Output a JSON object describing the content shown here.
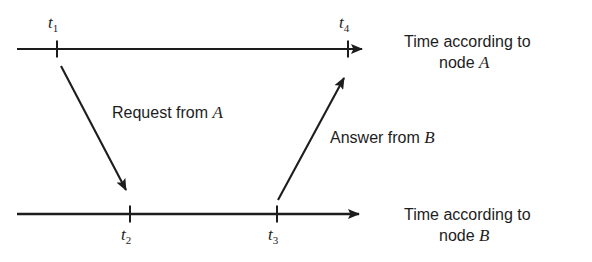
{
  "figure": {
    "background_color": "#ffffff",
    "stroke_color": "#1d1d1d",
    "width": 592,
    "height": 262
  },
  "timelines": [
    {
      "id": "timeline-a",
      "caption_line1": "Time according to",
      "caption_line2_prefix": "node ",
      "caption_line2_node": "A",
      "y": 49,
      "x_start": 17,
      "x_end": 373,
      "ticks": [
        {
          "id": "t1",
          "symbol": "t",
          "subscript": "1",
          "x": 57
        },
        {
          "id": "t4",
          "symbol": "t",
          "subscript": "4",
          "x": 348
        }
      ]
    },
    {
      "id": "timeline-b",
      "caption_line1": "Time according to",
      "caption_line2_prefix": "node ",
      "caption_line2_node": "B",
      "y": 214,
      "x_start": 17,
      "x_end": 370,
      "ticks": [
        {
          "id": "t2",
          "symbol": "t",
          "subscript": "2",
          "x": 130
        },
        {
          "id": "t3",
          "symbol": "t",
          "subscript": "3",
          "x": 277
        }
      ]
    }
  ],
  "messages": [
    {
      "id": "request",
      "label_prefix": "Request from ",
      "label_node": "A",
      "from": {
        "x": 61,
        "y": 66
      },
      "to": {
        "x": 130,
        "y": 198
      },
      "direction": "a-to-b"
    },
    {
      "id": "answer",
      "label_prefix": "Answer from ",
      "label_node": "B",
      "from": {
        "x": 278,
        "y": 200
      },
      "to": {
        "x": 348,
        "y": 70
      },
      "direction": "b-to-a"
    }
  ]
}
